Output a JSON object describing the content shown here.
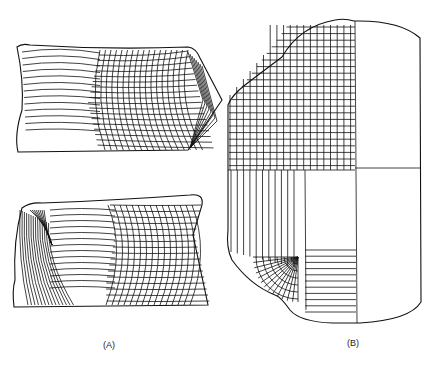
{
  "figure": {
    "panels": [
      {
        "id": "A",
        "label": "(A)",
        "description": "two distorted meshed blocks (top and bottom)"
      },
      {
        "id": "B",
        "label": "(B)",
        "description": "rounded outline with fine grid quadrant, radial fan mesh and strip mesh"
      }
    ]
  },
  "colors": {
    "line": "#111111",
    "background": "#ffffff"
  }
}
